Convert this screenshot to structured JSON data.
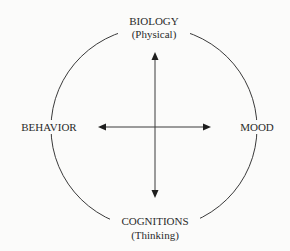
{
  "diagram": {
    "type": "cycle-cross",
    "nodes": {
      "top": {
        "label": "BIOLOGY",
        "sublabel": "(Physical)"
      },
      "right": {
        "label": "MOOD"
      },
      "bottom": {
        "label": "COGNITIONS",
        "sublabel": "(Thinking)"
      },
      "left": {
        "label": "BEHAVIOR"
      }
    },
    "arrows": [
      {
        "from": "center",
        "to": "top"
      },
      {
        "from": "center",
        "to": "bottom"
      },
      {
        "from": "center",
        "to": "left"
      },
      {
        "from": "center",
        "to": "right"
      }
    ],
    "colors": {
      "line": "#3a3a3a",
      "text": "#2a2a2a",
      "background": "#fbfbfa"
    }
  }
}
